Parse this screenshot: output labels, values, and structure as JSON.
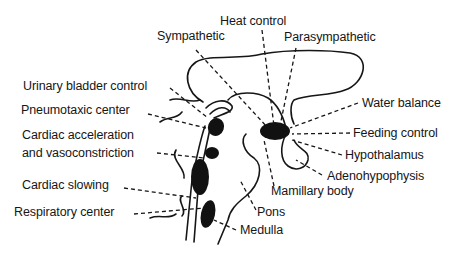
{
  "diagram": {
    "colors": {
      "ink": "#161616",
      "background": "#ffffff"
    },
    "labels": {
      "heat_control": "Heat control",
      "sympathetic": "Sympathetic",
      "parasympathetic": "Parasympathetic",
      "urinary_bladder_control": "Urinary bladder control",
      "pneumotaxic_center": "Pneumotaxic center",
      "cardiac_acceleration_line1": "Cardiac acceleration",
      "cardiac_acceleration_line2": "and vasoconstriction",
      "cardiac_slowing": "Cardiac slowing",
      "respiratory_center": "Respiratory center",
      "water_balance": "Water balance",
      "feeding_control": "Feeding control",
      "hypothalamus": "Hypothalamus",
      "adenohypophysis": "Adenohypophysis",
      "mamillary_body": "Mamillary body",
      "pons": "Pons",
      "medulla": "Medulla"
    }
  }
}
